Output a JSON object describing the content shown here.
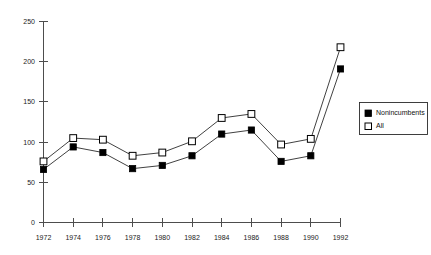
{
  "chart_data": {
    "type": "line",
    "title": "",
    "subtitle": "",
    "xlabel": "",
    "ylabel": "",
    "categories": [
      "1972",
      "1974",
      "1976",
      "1978",
      "1980",
      "1982",
      "1984",
      "1986",
      "1988",
      "1990",
      "1992"
    ],
    "x": [
      1972,
      1974,
      1976,
      1978,
      1980,
      1982,
      1984,
      1986,
      1988,
      1990,
      1992
    ],
    "series": [
      {
        "name": "Nonincumbents",
        "marker": "filled-square",
        "color": "#000000",
        "values": [
          66,
          94,
          87,
          67,
          71,
          83,
          110,
          115,
          76,
          83,
          191
        ]
      },
      {
        "name": "All",
        "marker": "open-square",
        "color": "#000000",
        "values": [
          76,
          105,
          103,
          83,
          87,
          101,
          130,
          135,
          97,
          104,
          218
        ]
      }
    ],
    "ylim": [
      0,
      250
    ],
    "yticks": [
      0,
      50,
      100,
      150,
      200,
      250
    ],
    "ytick_labels": [
      "0",
      "50",
      "100",
      "150",
      "200",
      "250"
    ],
    "xlim": [
      1972,
      1992
    ],
    "xticks": [
      1972,
      1974,
      1976,
      1978,
      1980,
      1982,
      1984,
      1986,
      1988,
      1990,
      1992
    ],
    "xtick_labels": [
      "1972",
      "1974",
      "1976",
      "1978",
      "1980",
      "1982",
      "1984",
      "1986",
      "1988",
      "1990",
      "1992"
    ],
    "grid": false,
    "legend_position": "right"
  },
  "legend": {
    "entries": [
      {
        "label": "Nonincumbents",
        "marker": "filled-square"
      },
      {
        "label": "All",
        "marker": "open-square"
      }
    ]
  },
  "axes": {
    "y_tick_labels": [
      "250",
      "200",
      "150",
      "100",
      "50",
      "0"
    ],
    "x_tick_labels": [
      "1972",
      "1974",
      "1976",
      "1978",
      "1980",
      "1982",
      "1984",
      "1986",
      "1988",
      "1990",
      "1992"
    ]
  }
}
